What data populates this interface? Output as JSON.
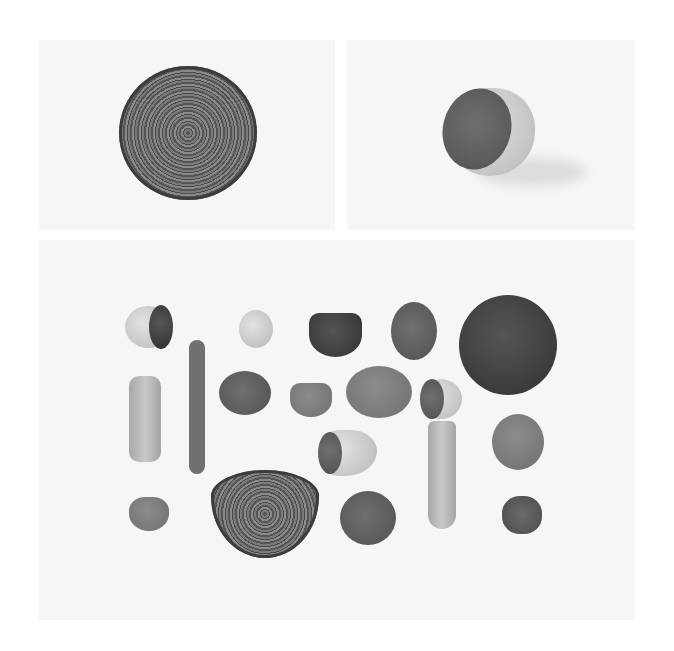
{
  "image": {
    "description": "Grayscale photo collage of halved vegetables on white backgrounds",
    "background_color": "#ffffff",
    "panel_color": "#f6f6f6"
  },
  "panels": [
    {
      "name": "top-left",
      "subject": "red cabbage cross-section"
    },
    {
      "name": "top-right",
      "subject": "halved turnip/beet with cut face"
    },
    {
      "name": "bottom",
      "subject": "arrangement of cut vegetables",
      "items": [
        "halved turnip",
        "long bean",
        "halved radish",
        "halved beet",
        "halved beet with root",
        "halved red cabbage",
        "carrot piece",
        "halved beet",
        "small halved radish",
        "halved sweet potato",
        "halved radish",
        "beet slice",
        "halved turnip cone",
        "carrot end",
        "small halved turnip",
        "halved red cabbage (dome)",
        "halved beet",
        "broccoli floret"
      ]
    }
  ]
}
